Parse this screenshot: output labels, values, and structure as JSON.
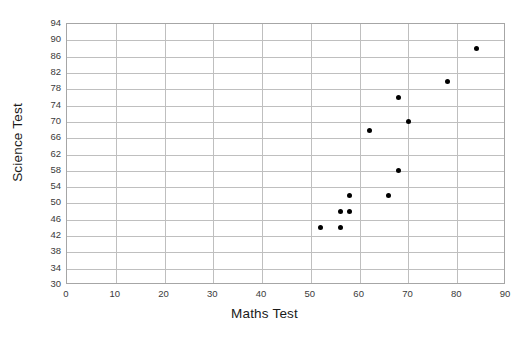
{
  "chart_data": {
    "type": "scatter",
    "title": "",
    "xlabel": "Maths Test",
    "ylabel": "Science Test",
    "xlim": [
      0,
      90
    ],
    "ylim": [
      30,
      94
    ],
    "xticks": [
      0,
      10,
      20,
      30,
      40,
      50,
      60,
      70,
      80,
      90
    ],
    "yticks": [
      30,
      34,
      38,
      42,
      46,
      50,
      54,
      58,
      62,
      66,
      70,
      74,
      78,
      82,
      86,
      90,
      94
    ],
    "grid": "horizontal-and-vertical",
    "legend": "none",
    "marker_color": "#000000",
    "grid_color": "#bfbfbf",
    "frame_color": "#a6a6a6",
    "series": [
      {
        "name": "students",
        "points": [
          {
            "x": 52,
            "y": 44
          },
          {
            "x": 56,
            "y": 44
          },
          {
            "x": 56,
            "y": 48
          },
          {
            "x": 58,
            "y": 48
          },
          {
            "x": 58,
            "y": 52
          },
          {
            "x": 62,
            "y": 68
          },
          {
            "x": 66,
            "y": 52
          },
          {
            "x": 68,
            "y": 58
          },
          {
            "x": 68,
            "y": 76
          },
          {
            "x": 70,
            "y": 70
          },
          {
            "x": 78,
            "y": 80
          },
          {
            "x": 84,
            "y": 88
          }
        ]
      }
    ]
  }
}
